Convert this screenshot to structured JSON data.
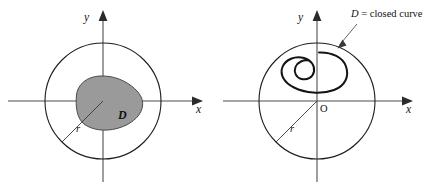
{
  "figure": {
    "type": "math-diagram",
    "width": 431,
    "height": 191,
    "background_color": "#ffffff"
  },
  "colors": {
    "axis": "#4d4d4d",
    "circle_stroke": "#1d1d1d",
    "region_fill": "#9a9a9a",
    "region_stroke": "#4a4a4a",
    "curve_stroke": "#141414",
    "leader": "#4a4a4a",
    "text": "#111111"
  },
  "panels": [
    {
      "id": "left",
      "name": "shaded-region-panel",
      "axes": {
        "x_label": "x",
        "y_label": "y",
        "origin_label": "",
        "x_arrow": true,
        "y_arrow": true
      },
      "circle": {
        "center": [
          103,
          101
        ],
        "radius": 58,
        "label": ""
      },
      "radius_segment": {
        "label": "r",
        "from": [
          103,
          101
        ],
        "to": [
          62,
          142
        ],
        "angle_deg": 225
      },
      "region": {
        "label": "D",
        "style": "shaded",
        "fill": "#9a9a9a",
        "center": [
          109,
          103
        ],
        "approx_rx": 34,
        "approx_ry": 27
      }
    },
    {
      "id": "right",
      "name": "closed-curve-panel",
      "axes": {
        "x_label": "x",
        "y_label": "y",
        "origin_label": "O",
        "x_arrow": true,
        "y_arrow": true
      },
      "circle": {
        "center": [
          317,
          101
        ],
        "radius": 58,
        "label": ""
      },
      "radius_segment": {
        "label": "r",
        "from": [
          317,
          101
        ],
        "to": [
          276,
          142
        ],
        "angle_deg": 225
      },
      "curve": {
        "label": "D = closed curve",
        "label_parts": {
          "symbol": "D",
          "rest": " = closed curve"
        },
        "style": "closed-loop-with-inner-loop",
        "outer_loop_center": [
          311,
          68
        ],
        "inner_loop_center": [
          312,
          61
        ],
        "inner_loop_radius": 9
      },
      "callout": {
        "text": "D = closed curve",
        "anchor_text_pos": [
          352,
          14
        ],
        "arrow_tip": [
          338,
          48
        ]
      }
    }
  ]
}
